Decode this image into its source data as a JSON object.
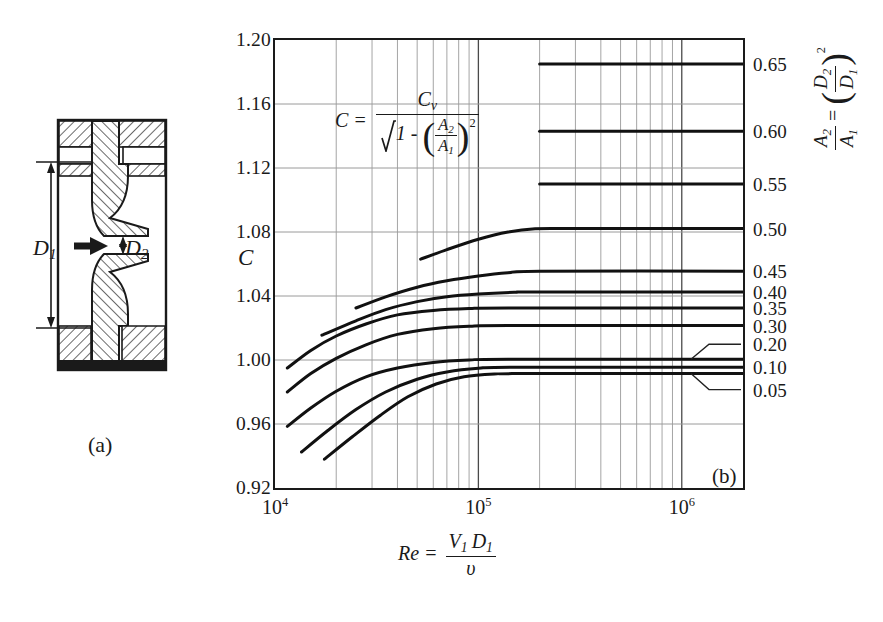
{
  "figure": {
    "panel_a_label": "(a)",
    "panel_b_label": "(b)",
    "c_symbol": "C",
    "nozzle": {
      "d1_label": "D",
      "d1_sub": "1",
      "d2_label": "D",
      "d2_sub": "2",
      "flow_arrow": "flow-direction-arrow"
    },
    "formula": {
      "lhs": "C =",
      "numerator_main": "C",
      "numerator_sub": "v",
      "denom_root_lead": "1 -",
      "denom_frac_num": "A",
      "denom_frac_num_sub": "2",
      "denom_frac_den": "A",
      "denom_frac_den_sub": "1",
      "denom_exp": "2"
    },
    "x_caption": {
      "lhs": "Re =",
      "num_v": "V",
      "num_v_sub": "1",
      "num_d": "D",
      "num_d_sub": "1",
      "den": "υ"
    },
    "right_caption": {
      "frac_num": "A",
      "frac_num_sub": "2",
      "frac_den": "A",
      "frac_den_sub": "1",
      "equals": "=",
      "paren_num": "D",
      "paren_num_sub": "2",
      "paren_den": "D",
      "paren_den_sub": "1",
      "exp": "2"
    }
  },
  "chart_data": {
    "type": "line",
    "title": "",
    "xlabel": "Re = V1 D1 / v",
    "ylabel": "C",
    "xscale": "log",
    "xlim": [
      10000,
      2000000
    ],
    "ylim": [
      0.92,
      1.2
    ],
    "grid": true,
    "legend_position": "right-axis-labels",
    "y_ticks": [
      "1.20",
      "1.16",
      "1.12",
      "1.08",
      "1.04",
      "1.00",
      "0.96",
      "0.92"
    ],
    "y_tick_values": [
      1.2,
      1.16,
      1.12,
      1.08,
      1.04,
      1.0,
      0.96,
      0.92
    ],
    "x_ticks": [
      "10",
      "10",
      "10"
    ],
    "x_tick_exponents": [
      "4",
      "5",
      "6"
    ],
    "x_tick_values": [
      10000,
      100000,
      1000000
    ],
    "series": [
      {
        "name": "0.65",
        "label": "0.65",
        "plateau": 1.185,
        "leader": false,
        "points": [
          [
            200000,
            1.185
          ],
          [
            2000000,
            1.185
          ]
        ]
      },
      {
        "name": "0.60",
        "label": "0.60",
        "plateau": 1.143,
        "leader": false,
        "points": [
          [
            200000,
            1.143
          ],
          [
            2000000,
            1.143
          ]
        ]
      },
      {
        "name": "0.55",
        "label": "0.55",
        "plateau": 1.11,
        "leader": false,
        "points": [
          [
            200000,
            1.11
          ],
          [
            2000000,
            1.11
          ]
        ]
      },
      {
        "name": "0.50",
        "label": "0.50",
        "plateau": 1.082,
        "leader": false,
        "points": [
          [
            52000,
            1.063
          ],
          [
            70000,
            1.069
          ],
          [
            100000,
            1.0755
          ],
          [
            140000,
            1.08
          ],
          [
            190000,
            1.082
          ],
          [
            300000,
            1.0822
          ],
          [
            2000000,
            1.0822
          ]
        ]
      },
      {
        "name": "0.45",
        "label": "0.45",
        "plateau": 1.0555,
        "leader": false,
        "points": [
          [
            25000,
            1.0325
          ],
          [
            35000,
            1.0395
          ],
          [
            50000,
            1.0455
          ],
          [
            70000,
            1.0495
          ],
          [
            100000,
            1.0525
          ],
          [
            140000,
            1.0545
          ],
          [
            200000,
            1.0555
          ],
          [
            2000000,
            1.0555
          ]
        ]
      },
      {
        "name": "0.40",
        "label": "0.40",
        "plateau": 1.0425,
        "leader": false,
        "points": [
          [
            17000,
            1.0155
          ],
          [
            25000,
            1.0245
          ],
          [
            35000,
            1.0315
          ],
          [
            50000,
            1.0365
          ],
          [
            70000,
            1.0395
          ],
          [
            100000,
            1.0412
          ],
          [
            150000,
            1.0423
          ],
          [
            200000,
            1.0425
          ],
          [
            2000000,
            1.0425
          ]
        ]
      },
      {
        "name": "0.35",
        "label": "0.35",
        "plateau": 1.0325,
        "leader": false,
        "points": [
          [
            11500,
            0.995
          ],
          [
            15000,
            1.006
          ],
          [
            20000,
            1.015
          ],
          [
            28000,
            1.0225
          ],
          [
            40000,
            1.0282
          ],
          [
            60000,
            1.031
          ],
          [
            90000,
            1.0322
          ],
          [
            140000,
            1.0325
          ],
          [
            2000000,
            1.0325
          ]
        ]
      },
      {
        "name": "0.30",
        "label": "0.30",
        "plateau": 1.0215,
        "leader": false,
        "points": [
          [
            11500,
            0.98
          ],
          [
            15000,
            0.9915
          ],
          [
            20000,
            1.001
          ],
          [
            28000,
            1.0095
          ],
          [
            40000,
            1.016
          ],
          [
            60000,
            1.0196
          ],
          [
            90000,
            1.0211
          ],
          [
            140000,
            1.0215
          ],
          [
            2000000,
            1.0215
          ]
        ]
      },
      {
        "name": "0.20",
        "label": "0.20",
        "plateau": 1.0005,
        "leader": true,
        "points": [
          [
            11500,
            0.9585
          ],
          [
            15000,
            0.97
          ],
          [
            20000,
            0.9805
          ],
          [
            28000,
            0.9895
          ],
          [
            40000,
            0.995
          ],
          [
            60000,
            0.9985
          ],
          [
            90000,
            1.0
          ],
          [
            140000,
            1.0005
          ],
          [
            2000000,
            1.0005
          ]
        ]
      },
      {
        "name": "0.10",
        "label": "0.10",
        "plateau": 0.9955,
        "leader": false,
        "points": [
          [
            13500,
            0.9425
          ],
          [
            18000,
            0.9555
          ],
          [
            25000,
            0.969
          ],
          [
            35000,
            0.98
          ],
          [
            50000,
            0.988
          ],
          [
            70000,
            0.9925
          ],
          [
            100000,
            0.9948
          ],
          [
            150000,
            0.9955
          ],
          [
            2000000,
            0.9955
          ]
        ]
      },
      {
        "name": "0.05",
        "label": "0.05",
        "plateau": 0.9915,
        "leader": true,
        "points": [
          [
            17500,
            0.938
          ],
          [
            24000,
            0.952
          ],
          [
            33000,
            0.9655
          ],
          [
            45000,
            0.977
          ],
          [
            62000,
            0.985
          ],
          [
            85000,
            0.9895
          ],
          [
            120000,
            0.9912
          ],
          [
            170000,
            0.9915
          ],
          [
            2000000,
            0.9915
          ]
        ]
      }
    ]
  }
}
